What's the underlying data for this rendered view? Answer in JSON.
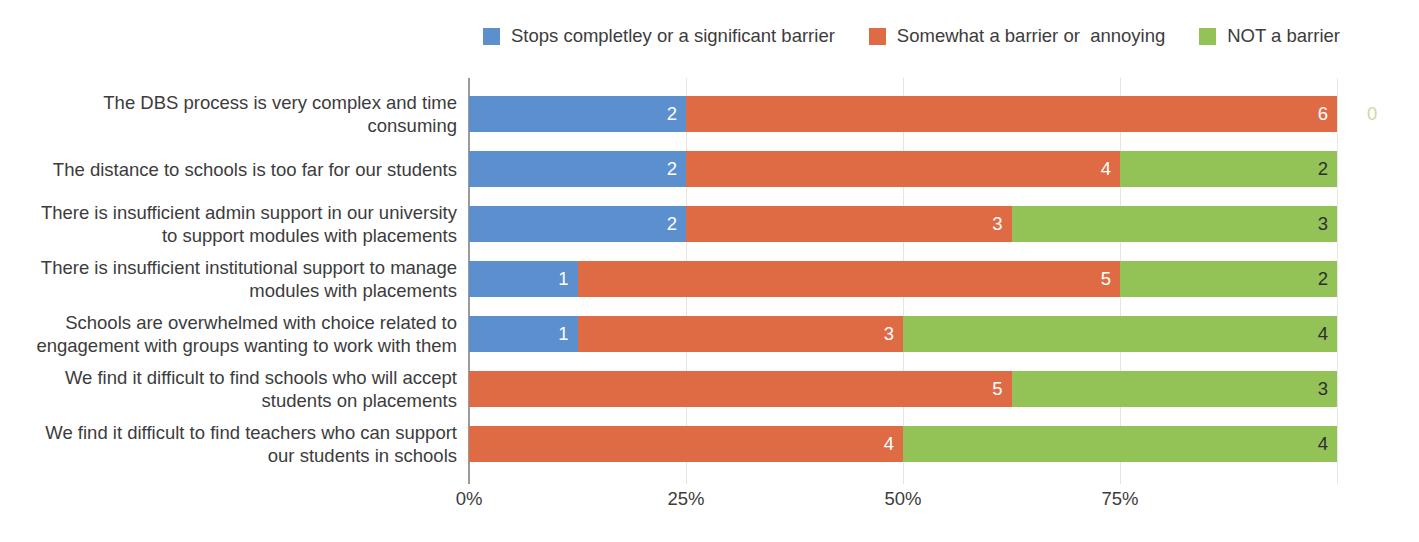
{
  "legend": {
    "position": "top-right",
    "items": [
      {
        "label": "Stops completley or a significant barrier",
        "color": "#5B8FCD",
        "name": "stops-completely"
      },
      {
        "label": "Somewhat a barrier or  annoying",
        "color": "#DF6B45",
        "name": "somewhat-barrier"
      },
      {
        "label": "NOT a barrier",
        "color": "#93C356",
        "name": "not-barrier"
      }
    ]
  },
  "axis": {
    "ticks": [
      "0%",
      "25%",
      "50%",
      "75%"
    ],
    "tick_positions": [
      0,
      25,
      50,
      75
    ],
    "max": 100,
    "grid": true
  },
  "colors": {
    "blue": "#5B8FCD",
    "orange": "#DF6B45",
    "green": "#93C356",
    "outside_zero_green": "#C9DBA6",
    "text": "#3c3c3c",
    "gridline": "#e4e4e4",
    "axis": "#9a9a9a"
  },
  "chart_data": {
    "type": "bar",
    "orientation": "horizontal",
    "stacked": true,
    "normalized": true,
    "title": "",
    "xlabel": "",
    "ylabel": "",
    "xlim": [
      0,
      100
    ],
    "xticks": [
      "0%",
      "25%",
      "50%",
      "75%"
    ],
    "grid": true,
    "legend_position": "top-right",
    "categories": [
      "The DBS process is very complex and time consuming",
      "The distance to schools is too far for our students",
      "There is insufficient admin support in our university to support modules with placements",
      "There is insufficient institutional support to manage modules with placements",
      "Schools are overwhelmed with choice related to engagement with groups wanting to work with them",
      "We find it difficult to find schools who will accept students on placements",
      "We find it difficult to find teachers who can support our students in schools"
    ],
    "series": [
      {
        "name": "Stops completley or a significant barrier",
        "color": "#5B8FCD",
        "values": [
          2,
          2,
          2,
          1,
          1,
          0,
          0
        ]
      },
      {
        "name": "Somewhat a barrier or  annoying",
        "color": "#DF6B45",
        "values": [
          6,
          4,
          3,
          5,
          3,
          5,
          4
        ]
      },
      {
        "name": "NOT a barrier",
        "color": "#93C356",
        "values": [
          0,
          2,
          3,
          2,
          4,
          3,
          4
        ]
      }
    ],
    "row_totals": [
      8,
      8,
      8,
      8,
      8,
      8,
      8
    ],
    "percentages": [
      [
        25.0,
        75.0,
        0.0
      ],
      [
        25.0,
        50.0,
        25.0
      ],
      [
        25.0,
        37.5,
        37.5
      ],
      [
        12.5,
        62.5,
        25.0
      ],
      [
        12.5,
        37.5,
        50.0
      ],
      [
        0.0,
        62.5,
        37.5
      ],
      [
        0.0,
        50.0,
        50.0
      ]
    ]
  },
  "rows": [
    {
      "label_lines": [
        "The DBS process is very complex and time",
        "consuming"
      ],
      "segments": [
        {
          "value": "2",
          "pct": 25.0,
          "color": "#5B8FCD",
          "label_style": "light",
          "name": "segment-blue"
        },
        {
          "value": "6",
          "pct": 75.0,
          "color": "#DF6B45",
          "label_style": "light",
          "name": "segment-orange"
        },
        {
          "value": "0",
          "pct": 0.0,
          "color": "#93C356",
          "label_style": "outside",
          "name": "segment-green"
        }
      ]
    },
    {
      "label_lines": [
        "The distance to schools is too far for our students"
      ],
      "segments": [
        {
          "value": "2",
          "pct": 25.0,
          "color": "#5B8FCD",
          "label_style": "light",
          "name": "segment-blue"
        },
        {
          "value": "4",
          "pct": 50.0,
          "color": "#DF6B45",
          "label_style": "light",
          "name": "segment-orange"
        },
        {
          "value": "2",
          "pct": 25.0,
          "color": "#93C356",
          "label_style": "dark",
          "name": "segment-green"
        }
      ]
    },
    {
      "label_lines": [
        "There is insufficient admin support in our university",
        "to support modules with placements"
      ],
      "segments": [
        {
          "value": "2",
          "pct": 25.0,
          "color": "#5B8FCD",
          "label_style": "light",
          "name": "segment-blue"
        },
        {
          "value": "3",
          "pct": 37.5,
          "color": "#DF6B45",
          "label_style": "light",
          "name": "segment-orange"
        },
        {
          "value": "3",
          "pct": 37.5,
          "color": "#93C356",
          "label_style": "dark",
          "name": "segment-green"
        }
      ]
    },
    {
      "label_lines": [
        "There is insufficient institutional support to manage",
        "modules with placements"
      ],
      "segments": [
        {
          "value": "1",
          "pct": 12.5,
          "color": "#5B8FCD",
          "label_style": "light",
          "name": "segment-blue"
        },
        {
          "value": "5",
          "pct": 62.5,
          "color": "#DF6B45",
          "label_style": "light",
          "name": "segment-orange"
        },
        {
          "value": "2",
          "pct": 25.0,
          "color": "#93C356",
          "label_style": "dark",
          "name": "segment-green"
        }
      ]
    },
    {
      "label_lines": [
        "Schools are overwhelmed with choice related to",
        "engagement with groups wanting to work with them"
      ],
      "segments": [
        {
          "value": "1",
          "pct": 12.5,
          "color": "#5B8FCD",
          "label_style": "light",
          "name": "segment-blue"
        },
        {
          "value": "3",
          "pct": 37.5,
          "color": "#DF6B45",
          "label_style": "light",
          "name": "segment-orange"
        },
        {
          "value": "4",
          "pct": 50.0,
          "color": "#93C356",
          "label_style": "dark",
          "name": "segment-green"
        }
      ]
    },
    {
      "label_lines": [
        "We find it difficult to find schools who will accept",
        "students on placements"
      ],
      "segments": [
        {
          "value": "0",
          "pct": 0.0,
          "color": "#5B8FCD",
          "label_style": "zero-inside",
          "name": "segment-blue"
        },
        {
          "value": "5",
          "pct": 62.5,
          "color": "#DF6B45",
          "label_style": "light",
          "name": "segment-orange"
        },
        {
          "value": "3",
          "pct": 37.5,
          "color": "#93C356",
          "label_style": "dark",
          "name": "segment-green"
        }
      ]
    },
    {
      "label_lines": [
        "We find it difficult to find teachers who can support",
        "our students in schools"
      ],
      "segments": [
        {
          "value": "0",
          "pct": 0.0,
          "color": "#5B8FCD",
          "label_style": "zero-inside",
          "name": "segment-blue"
        },
        {
          "value": "4",
          "pct": 50.0,
          "color": "#DF6B45",
          "label_style": "light",
          "name": "segment-orange"
        },
        {
          "value": "4",
          "pct": 50.0,
          "color": "#93C356",
          "label_style": "dark",
          "name": "segment-green"
        }
      ]
    }
  ]
}
